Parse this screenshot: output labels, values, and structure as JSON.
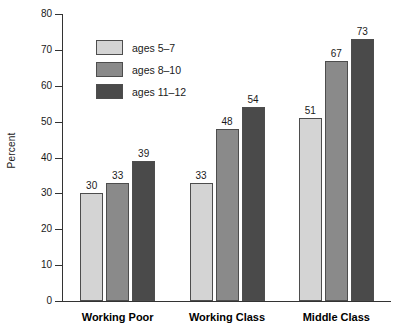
{
  "chart_data": {
    "type": "bar",
    "title": "",
    "subtitle": "",
    "xlabel": "",
    "ylabel": "Percent",
    "ylim": [
      0,
      80
    ],
    "ytick_step": 10,
    "yticks": [
      80,
      70,
      60,
      50,
      40,
      30,
      20,
      10,
      0
    ],
    "grid": false,
    "legend_position": "inside-top-left",
    "categories": [
      "Working Poor",
      "Working Class",
      "Middle Class"
    ],
    "series": [
      {
        "name": "ages 5–7",
        "values": [
          30,
          33,
          51
        ],
        "color": "#d4d4d4"
      },
      {
        "name": "ages 8–10",
        "values": [
          33,
          48,
          67
        ],
        "color": "#8a8a8a"
      },
      {
        "name": "ages 11–12",
        "values": [
          39,
          54,
          73
        ],
        "color": "#4a4a4a"
      }
    ],
    "data_labels": true
  },
  "legend": {
    "items": [
      {
        "label": "ages 5–7"
      },
      {
        "label": "ages 8–10"
      },
      {
        "label": "ages 11–12"
      }
    ]
  },
  "axis": {
    "y_title": "Percent"
  },
  "colors": {
    "background": "#ffffff",
    "axis": "#333333",
    "text": "#1a1a1a",
    "bar_border": "#4d4d4d",
    "series_light": "#d4d4d4",
    "series_medium": "#8a8a8a",
    "series_dark": "#4a4a4a"
  }
}
